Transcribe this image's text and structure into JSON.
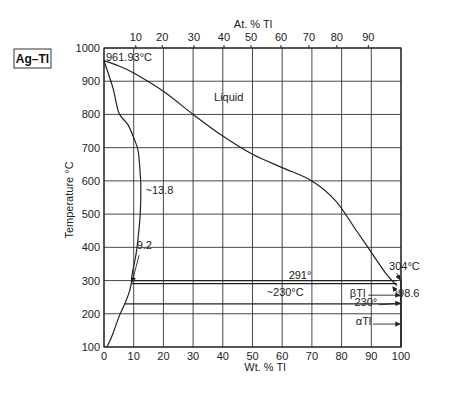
{
  "chart_data": {
    "type": "line",
    "title": "Ag–Tl",
    "xlabel": "Wt. % Tl",
    "x2label": "At. % Tl",
    "ylabel": "Temperature °C",
    "xlim": [
      0,
      100
    ],
    "ylim": [
      100,
      1000
    ],
    "grid": true,
    "x_ticks": [
      "0",
      "10",
      "20",
      "30",
      "40",
      "50",
      "60",
      "70",
      "80",
      "90",
      "100"
    ],
    "y_ticks": [
      "100",
      "200",
      "300",
      "400",
      "500",
      "600",
      "700",
      "800",
      "900",
      "1000"
    ],
    "x2_ticks": [
      {
        "label": "10",
        "wt": 10.7
      },
      {
        "label": "20",
        "wt": 19.6
      },
      {
        "label": "30",
        "wt": 30.3
      },
      {
        "label": "40",
        "wt": 40.4
      },
      {
        "label": "50",
        "wt": 49.5
      },
      {
        "label": "60",
        "wt": 59.6
      },
      {
        "label": "70",
        "wt": 69.0
      },
      {
        "label": "80",
        "wt": 78.4
      },
      {
        "label": "90",
        "wt": 89.0
      }
    ],
    "series": [
      {
        "name": "Liquidus",
        "x": [
          0,
          5,
          10,
          20,
          30,
          40,
          50,
          60,
          70,
          78,
          85,
          90,
          95,
          98.6
        ],
        "y": [
          961.93,
          946,
          925,
          870,
          800,
          735,
          680,
          640,
          600,
          540,
          450,
          385,
          320,
          285
        ]
      },
      {
        "name": "Solidus",
        "x": [
          0,
          3,
          5,
          8,
          10,
          11.5,
          12.2,
          12.4,
          12.2,
          11.5,
          10.8,
          9.5,
          9.2
        ],
        "y": [
          961.93,
          880,
          805,
          770,
          730,
          690,
          620,
          580,
          500,
          430,
          380,
          320,
          291
        ]
      },
      {
        "name": "Solvus",
        "x": [
          1,
          3,
          5,
          7,
          8.5,
          9.2
        ],
        "y": [
          100,
          140,
          190,
          230,
          265,
          291
        ]
      },
      {
        "name": "Eutectic 291°",
        "x": [
          9.2,
          98.6
        ],
        "y": [
          291,
          291
        ]
      },
      {
        "name": "Eutectic 291° (upper line)",
        "x": [
          9.2,
          98.6
        ],
        "y": [
          300,
          300
        ]
      },
      {
        "name": "Transformation ~230°C",
        "x": [
          7,
          100
        ],
        "y": [
          230,
          230
        ]
      }
    ],
    "annotations": [
      {
        "text": "961.93°C",
        "x": 0,
        "y": 961.93
      },
      {
        "text": "Liquid",
        "x": 42,
        "y": 840
      },
      {
        "text": "~13.8",
        "x": 14,
        "y": 560
      },
      {
        "text": "9.2",
        "x": 11,
        "y": 395
      },
      {
        "text": "291°",
        "x": 66,
        "y": 305
      },
      {
        "text": "~230°C",
        "x": 61,
        "y": 255
      },
      {
        "text": "304°C",
        "x": 96,
        "y": 333
      },
      {
        "text": "βTl",
        "x": 88,
        "y": 252
      },
      {
        "text": "98.6",
        "x": 99,
        "y": 250
      },
      {
        "text": "230°",
        "x": 92,
        "y": 224
      },
      {
        "text": "αTl",
        "x": 90,
        "y": 165
      }
    ]
  }
}
